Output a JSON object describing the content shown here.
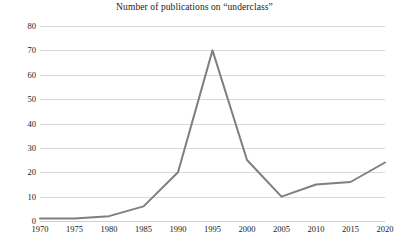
{
  "chart_data": {
    "type": "line",
    "title": "Number of publications on “underclass”",
    "xlabel": "",
    "ylabel": "",
    "x": [
      1970,
      1975,
      1980,
      1985,
      1990,
      1995,
      2000,
      2005,
      2010,
      2015,
      2020
    ],
    "categories": [
      "1970",
      "1975",
      "1980",
      "1985",
      "1990",
      "1995",
      "2000",
      "2005",
      "2010",
      "2015",
      "2020"
    ],
    "values": [
      1,
      1,
      2,
      6,
      20,
      70,
      25,
      10,
      15,
      16,
      24
    ],
    "series": [
      {
        "name": "Number of publications",
        "values": [
          1,
          1,
          2,
          6,
          20,
          70,
          25,
          10,
          15,
          16,
          24
        ]
      }
    ],
    "xlim": [
      1970,
      2020
    ],
    "ylim": [
      0,
      80
    ],
    "y_ticks": [
      0,
      10,
      20,
      30,
      40,
      50,
      60,
      70,
      80
    ],
    "y_tick_labels": [
      "0",
      "10",
      "20",
      "30",
      "40",
      "50",
      "60",
      "70",
      "80"
    ],
    "x_ticks": [
      1970,
      1975,
      1980,
      1985,
      1990,
      1995,
      2000,
      2005,
      2010,
      2015,
      2020
    ],
    "x_tick_labels": [
      "1970",
      "1975",
      "1980",
      "1985",
      "1990",
      "1995",
      "2000",
      "2005",
      "2010",
      "2015",
      "2020"
    ],
    "grid": "horizontal",
    "legend": "none",
    "line_color": "#7f7f7f",
    "grid_color": "#d9d9d9",
    "background_color": "#ffffff",
    "text_color": "#1a1a1a",
    "annotations": []
  }
}
